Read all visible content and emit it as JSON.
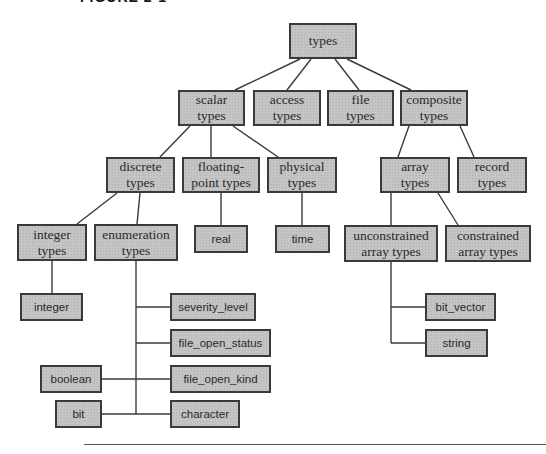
{
  "figure": {
    "header": "FIGURE 2-1"
  },
  "nodes": {
    "types": "types",
    "scalar": "scalar types",
    "access": "access types",
    "file": "file types",
    "composite": "composite types",
    "discrete": "discrete types",
    "floating": "floating-point types",
    "physical": "physical types",
    "array": "array types",
    "record": "record types",
    "integer_types": "integer types",
    "enumeration": "enumeration types",
    "real": "real",
    "time": "time",
    "unconstrained": "unconstrained array types",
    "constrained": "constrained array types",
    "integer": "integer",
    "severity_level": "severity_level",
    "file_open_status": "file_open_status",
    "file_open_kind": "file_open_kind",
    "character": "character",
    "boolean": "boolean",
    "bit": "bit",
    "bit_vector": "bit_vector",
    "string": "string"
  },
  "labels": {
    "types": [
      "types"
    ],
    "scalar": [
      "scalar",
      "types"
    ],
    "access": [
      "access",
      "types"
    ],
    "file": [
      "file",
      "types"
    ],
    "composite": [
      "composite",
      "types"
    ],
    "discrete": [
      "discrete",
      "types"
    ],
    "floating": [
      "floating-",
      "point types"
    ],
    "physical": [
      "physical",
      "types"
    ],
    "array": [
      "array",
      "types"
    ],
    "record": [
      "record",
      "types"
    ],
    "integer_types": [
      "integer",
      "types"
    ],
    "enumeration": [
      "enumeration",
      "types"
    ],
    "unconstrained": [
      "unconstrained",
      "array types"
    ],
    "constrained": [
      "constrained",
      "array types"
    ]
  },
  "colors": {
    "box_fill": "#c4c4c4",
    "box_border": "#3a3a3a",
    "line": "#3a3a3a"
  }
}
